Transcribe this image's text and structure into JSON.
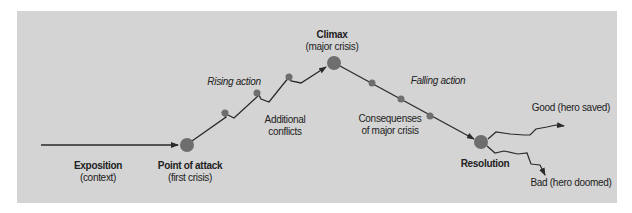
{
  "diagram": {
    "type": "dramatic-arc (Freytag pyramid)",
    "colors": {
      "background": "#d4d4d4",
      "line": "#2a2a2a",
      "node": "#6e6e6e",
      "text": "#222222"
    },
    "labels": {
      "exposition": {
        "title": "Exposition",
        "subtitle": "(context)"
      },
      "point_of_attack": {
        "title": "Point of attack",
        "subtitle": "(first crisis)"
      },
      "rising_action": "Rising action",
      "additional_conflicts": {
        "line1": "Additional",
        "line2": "conflicts"
      },
      "climax": {
        "title": "Climax",
        "subtitle": "(major crisis)"
      },
      "falling_action": "Falling action",
      "consequences": {
        "line1": "Consequenses",
        "line2": "of major crisis"
      },
      "resolution": {
        "title": "Resolution"
      },
      "good_ending": "Good (hero saved)",
      "bad_ending": "Bad (hero doomed)"
    },
    "nodes": [
      {
        "id": "point-of-attack",
        "x": 187,
        "y": 145,
        "size": "large"
      },
      {
        "id": "rising-1",
        "x": 226,
        "y": 117,
        "size": "small"
      },
      {
        "id": "rising-2",
        "x": 259,
        "y": 95,
        "size": "small"
      },
      {
        "id": "rising-3",
        "x": 289,
        "y": 77,
        "size": "small"
      },
      {
        "id": "climax",
        "x": 334,
        "y": 63,
        "size": "large"
      },
      {
        "id": "falling-1",
        "x": 372,
        "y": 82,
        "size": "small"
      },
      {
        "id": "falling-2",
        "x": 401,
        "y": 99,
        "size": "small"
      },
      {
        "id": "falling-3",
        "x": 430,
        "y": 116,
        "size": "small"
      },
      {
        "id": "resolution",
        "x": 481,
        "y": 142,
        "size": "large"
      }
    ]
  }
}
